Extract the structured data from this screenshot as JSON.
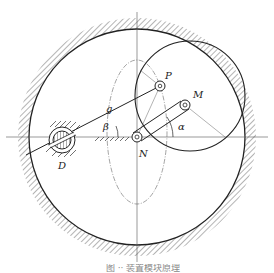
{
  "figure": {
    "type": "mechanism-schematic",
    "labels": {
      "P": "P",
      "M": "M",
      "N": "N",
      "D": "D",
      "g": "g",
      "alpha": "α",
      "beta": "β"
    },
    "caption": "图 ·· 装置模块原理",
    "colors": {
      "line": "#222222",
      "thin_line": "#555555",
      "hatch": "#444444",
      "background": "#ffffff"
    },
    "geometry": {
      "outer_circle": {
        "cx": 137,
        "cy": 137,
        "r": 108
      },
      "inner_circle": {
        "cx": 190,
        "cy": 96,
        "r": 55
      },
      "dashed_ellipse": {
        "cx": 137,
        "cy": 132,
        "rx": 30,
        "ry": 72
      },
      "point_N": {
        "x": 137,
        "y": 137
      },
      "point_P": {
        "x": 160,
        "y": 86
      },
      "point_M": {
        "x": 185,
        "y": 105
      },
      "point_D": {
        "x": 62,
        "y": 140
      }
    }
  }
}
